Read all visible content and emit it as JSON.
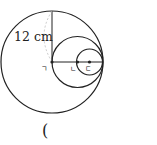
{
  "diagram": {
    "radius_label": "12 cm",
    "points": [
      {
        "label": "ㄱ"
      },
      {
        "label": "ㄴ"
      },
      {
        "label": "ㄷ"
      }
    ],
    "answer_paren": "(",
    "circles": [
      {
        "name": "large",
        "cx": 52,
        "cy": 62,
        "r": 51
      },
      {
        "name": "medium",
        "cx": 77.5,
        "cy": 62,
        "r": 25.5
      },
      {
        "name": "small",
        "cx": 89.5,
        "cy": 62,
        "r": 13
      }
    ],
    "stroke_color": "#222222"
  }
}
